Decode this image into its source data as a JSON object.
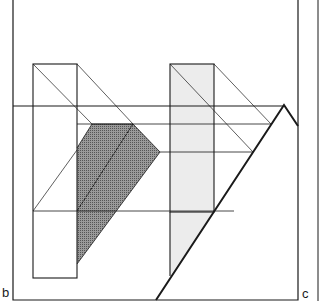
{
  "figure": {
    "panel_labels": {
      "left": "b",
      "right": "c"
    },
    "colors": {
      "stroke": "#1a1a1a",
      "dark_shade": "#8a8a8a",
      "light_shade": "#ececec",
      "background": "#ffffff"
    },
    "elements": [
      "frame",
      "horizon-line",
      "left-prism",
      "right-prism",
      "shadow-dark",
      "shadow-light",
      "ground-ray"
    ]
  }
}
